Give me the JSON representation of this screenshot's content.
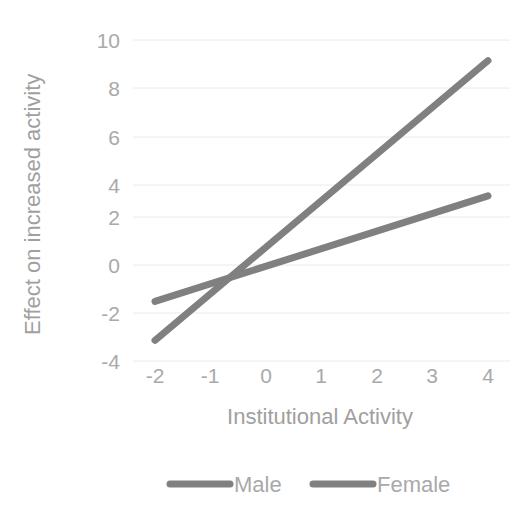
{
  "chart_data": {
    "type": "line",
    "title": "",
    "xlabel": "Institutional Activity",
    "ylabel": "Effect on increased activity",
    "xlim": [
      -2,
      4
    ],
    "ylim": [
      -4,
      10
    ],
    "x_ticks": [
      "-2",
      "-1",
      "0",
      "1",
      "2",
      "3",
      "4"
    ],
    "y_ticks": [
      "10",
      "8",
      "6",
      "4",
      "2",
      "0",
      "-2",
      "-4"
    ],
    "x": [
      -2,
      4
    ],
    "grid": "horizontal",
    "legend_position": "bottom",
    "series": [
      {
        "name": "Male",
        "values": [
          -3.1,
          9.1
        ],
        "color": "#808080"
      },
      {
        "name": "Female",
        "values": [
          -1.4,
          3.2
        ],
        "color": "#808080"
      }
    ]
  },
  "axes": {
    "y_label": "Effect on increased activity",
    "x_label": "Institutional Activity",
    "y_ticks": [
      {
        "label": "10"
      },
      {
        "label": "8"
      },
      {
        "label": "6"
      },
      {
        "label": "4"
      },
      {
        "label": "2"
      },
      {
        "label": "0"
      },
      {
        "label": "-2"
      },
      {
        "label": "-4"
      }
    ],
    "x_ticks": [
      {
        "label": "-2"
      },
      {
        "label": "-1"
      },
      {
        "label": "0"
      },
      {
        "label": "1"
      },
      {
        "label": "2"
      },
      {
        "label": "3"
      },
      {
        "label": "4"
      }
    ]
  },
  "legend": {
    "items": [
      {
        "label": "Male",
        "color": "#808080"
      },
      {
        "label": "Female",
        "color": "#808080"
      }
    ]
  },
  "colors": {
    "male_line": "#808080",
    "female_line": "#808080",
    "tick_text": "#a9a9a9",
    "axis_title": "#a0a0a0",
    "gridline": "#eceaea",
    "background": "#ffffff"
  }
}
